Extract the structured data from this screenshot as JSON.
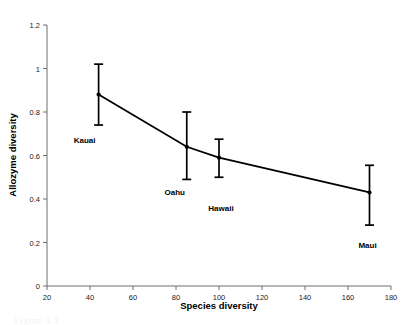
{
  "chart_data": {
    "type": "line",
    "title": "",
    "xlabel": "Species diversity",
    "ylabel": "Allozyme diversity",
    "xlim": [
      20,
      180
    ],
    "ylim": [
      0,
      1.2
    ],
    "xticks": [
      20,
      40,
      60,
      80,
      100,
      120,
      140,
      160,
      180
    ],
    "xtick_labels": [
      "20",
      "40",
      "60",
      "80",
      "100",
      "120",
      "140",
      "160",
      "180"
    ],
    "yticks": [
      0,
      0.2,
      0.4,
      0.6,
      0.8,
      1,
      1.2
    ],
    "ytick_labels": [
      "0",
      "0.2",
      "0.4",
      "0.6",
      "0.8",
      "1",
      "1.2"
    ],
    "grid": false,
    "legend": "none",
    "error_bars": "vertical",
    "series": [
      {
        "name": "Hawaiian islands",
        "marker": "filled-circle",
        "line_color": "#000000",
        "points": [
          {
            "label": "Kauai",
            "x": 44,
            "y": 0.88,
            "err_low": 0.74,
            "err_high": 1.02,
            "label_dx": -14,
            "label_dy": 48
          },
          {
            "label": "Oahu",
            "x": 85,
            "y": 0.64,
            "err_low": 0.49,
            "err_high": 0.8,
            "label_dx": -12,
            "label_dy": 48
          },
          {
            "label": "Hawaii",
            "x": 100,
            "y": 0.59,
            "err_low": 0.5,
            "err_high": 0.675,
            "label_dx": 2,
            "label_dy": 53
          },
          {
            "label": "Maui",
            "x": 170,
            "y": 0.43,
            "err_low": 0.28,
            "err_high": 0.555,
            "label_dx": -2,
            "label_dy": 56
          }
        ]
      }
    ]
  },
  "caption": {
    "text": "Figure 1.1"
  },
  "colors": {
    "axis": "#6f6f6f",
    "data": "#000000",
    "background": "#ffffff",
    "tick_text": "#1a1a1a"
  }
}
